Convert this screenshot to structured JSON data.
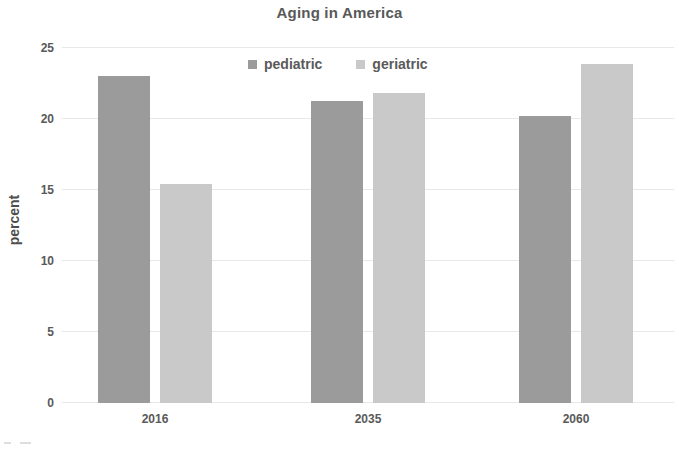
{
  "chart_data": {
    "type": "bar",
    "title": "Aging in America",
    "xlabel": "",
    "ylabel": "percent",
    "categories": [
      "2016",
      "2035",
      "2060"
    ],
    "series": [
      {
        "name": "pediatric",
        "values": [
          23.0,
          21.3,
          20.2
        ],
        "color": "#9b9b9b"
      },
      {
        "name": "geriatric",
        "values": [
          15.4,
          21.8,
          23.9
        ],
        "color": "#c9c9c9"
      }
    ],
    "ylim": [
      0,
      25
    ],
    "ytick_labels": [
      "0",
      "5",
      "10",
      "15",
      "20",
      "25"
    ],
    "ytick_values": [
      0,
      5,
      10,
      15,
      20,
      25
    ],
    "grid": true,
    "legend_position": "top-center"
  },
  "legend": {
    "items": [
      {
        "label": "pediatric",
        "swatch_icon": "legend-swatch-square",
        "color": "#9b9b9b"
      },
      {
        "label": "geriatric",
        "swatch_icon": "legend-swatch-square",
        "color": "#c9c9c9"
      }
    ]
  },
  "colors": {
    "background": "#ffffff",
    "gridline": "#e8e8e8",
    "axis_text": "#595959",
    "title_text": "#595959",
    "series_pediatric": "#9b9b9b",
    "series_geriatric": "#c9c9c9"
  }
}
